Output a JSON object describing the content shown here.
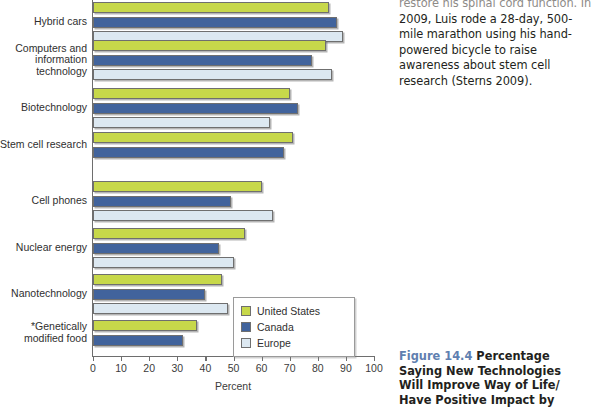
{
  "chart_data": {
    "type": "bar",
    "orientation": "horizontal",
    "title": "",
    "xlabel": "Percent",
    "ylabel": "",
    "xlim": [
      0,
      100
    ],
    "xticks": [
      0,
      10,
      20,
      30,
      40,
      50,
      60,
      70,
      80,
      90,
      100
    ],
    "grid": false,
    "legend_position": "inside bottom-right",
    "categories": [
      "Hybrid cars",
      "Computers and information technology",
      "Biotechnology",
      "*Stem cell research",
      "Cell phones",
      "Nuclear energy",
      "Nanotechnology",
      "*Genetically modified food"
    ],
    "series": [
      {
        "name": "United States",
        "color": "#c7d84a",
        "values": [
          84,
          83,
          70,
          71,
          60,
          54,
          46,
          37
        ]
      },
      {
        "name": "Canada",
        "color": "#41639c",
        "values": [
          87,
          78,
          73,
          68,
          49,
          45,
          40,
          32
        ]
      },
      {
        "name": "Europe",
        "color": "#dce8f1",
        "values": [
          89,
          85,
          63,
          null,
          64,
          50,
          48,
          null
        ]
      }
    ]
  },
  "chart": {
    "x_axis_title": "Percent",
    "tick_labels": [
      "0",
      "10",
      "20",
      "30",
      "40",
      "50",
      "60",
      "70",
      "80",
      "90",
      "100"
    ],
    "categories": [
      {
        "label_line1": "Hybrid cars",
        "label_line2": "",
        "label_line3": ""
      },
      {
        "label_line1": "Computers and",
        "label_line2": "information",
        "label_line3": "technology"
      },
      {
        "label_line1": "Biotechnology",
        "label_line2": "",
        "label_line3": ""
      },
      {
        "label_line1": "*Stem cell research",
        "label_line2": "",
        "label_line3": ""
      },
      {
        "label_line1": "Cell phones",
        "label_line2": "",
        "label_line3": ""
      },
      {
        "label_line1": "Nuclear energy",
        "label_line2": "",
        "label_line3": ""
      },
      {
        "label_line1": "Nanotechnology",
        "label_line2": "",
        "label_line3": ""
      },
      {
        "label_line1": "*Genetically",
        "label_line2": "modified food",
        "label_line3": ""
      }
    ],
    "legend": [
      {
        "label": "United States",
        "color": "#c7d84a"
      },
      {
        "label": "Canada",
        "color": "#41639c"
      },
      {
        "label": "Europe",
        "color": "#dce8f1"
      }
    ]
  },
  "right_column": {
    "body_first_line_clipped": "restore his spinal cord function. In",
    "body_text": "2009, Luis rode a 28-day, 500-mile marathon using his hand-powered bicycle to raise awareness about stem cell research (Sterns 2009).",
    "caption_figure_number": "Figure 14.4",
    "caption_text": " Percentage Saying New Technologies Will Improve Way of Life/ Have Positive Impact by"
  }
}
